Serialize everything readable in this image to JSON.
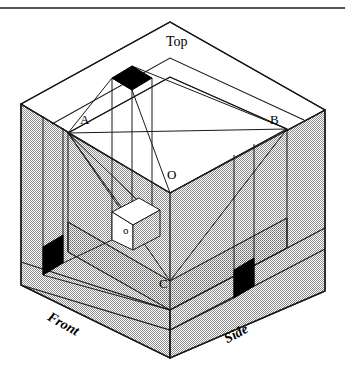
{
  "figure": {
    "colors": {
      "stroke": "#1a1a1a",
      "fill_shaded": "#c8c8c8",
      "fill_shaded_light": "#d6d6d6",
      "fill_white": "#ffffff",
      "fill_black": "#000000",
      "background": "#ffffff"
    },
    "rule": {
      "name": "top-horizontal-rule",
      "y": 8,
      "x1": 0,
      "x2": 345
    },
    "face_labels": [
      {
        "id": "top",
        "text": "Top",
        "x": 166,
        "y": 35,
        "rotation": 0,
        "style": "plain"
      },
      {
        "id": "front",
        "text": "Front",
        "x": 52,
        "y": 310,
        "rotation": 29,
        "style": "italic"
      },
      {
        "id": "side",
        "text": "Side",
        "x": 222,
        "y": 334,
        "rotation": -29,
        "style": "italic"
      }
    ],
    "point_labels": [
      {
        "id": "A",
        "text": "A",
        "x": 80,
        "y": 113
      },
      {
        "id": "B",
        "text": "B",
        "x": 270,
        "y": 113
      },
      {
        "id": "O-big",
        "text": "O",
        "x": 167,
        "y": 168
      },
      {
        "id": "O-sm",
        "text": "o",
        "x": 123,
        "y": 225
      },
      {
        "id": "C",
        "text": "C",
        "x": 159,
        "y": 277
      }
    ],
    "black_markers": [
      {
        "id": "top-marker",
        "points": "112,78 132,66 152,78 132,90"
      },
      {
        "id": "left-marker",
        "points": "43,247 63,235 63,263 43,275"
      },
      {
        "id": "right-marker",
        "points": "234,270 254,258 254,286 234,298"
      }
    ],
    "geometry": {
      "outer_cube": {
        "top_apex": [
          170,
          22
        ],
        "left_corner": [
          21,
          104
        ],
        "right_corner": [
          325,
          110
        ],
        "center_front": [
          170,
          193
        ],
        "bottom_left": [
          21,
          285
        ],
        "bottom_right": [
          325,
          291
        ],
        "bottom_front": [
          170,
          358
        ]
      },
      "notch": {
        "A": [
          68,
          133
        ],
        "B": [
          287,
          129
        ],
        "O": [
          170,
          193
        ],
        "C": [
          170,
          281
        ]
      }
    }
  }
}
